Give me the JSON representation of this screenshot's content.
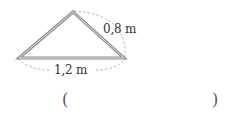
{
  "figure": {
    "shape": "triangle",
    "side_label": "0,8 m",
    "base_label": "1,2 m",
    "colors": {
      "edge": "#8c8c8c",
      "edge_inner": "#d9d9d9",
      "dashed_arc": "#a0a0a0",
      "text": "#333333"
    },
    "vertices": {
      "left": [
        19,
        58
      ],
      "apex": [
        73,
        12
      ],
      "right": [
        124,
        58
      ]
    }
  },
  "answer": {
    "open_paren": "(",
    "close_paren": ")",
    "value": ""
  }
}
